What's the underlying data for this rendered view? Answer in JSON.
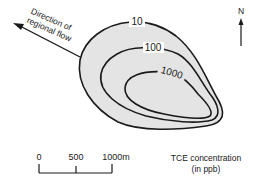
{
  "diagram": {
    "flow": {
      "line1": "Direction of",
      "line2": "regional flow"
    },
    "north_label": "N",
    "contours": [
      {
        "label": "10"
      },
      {
        "label": "100"
      },
      {
        "label": "1000"
      }
    ],
    "scale_bar": {
      "ticks": [
        "0",
        "500",
        "1000m"
      ]
    },
    "legend": {
      "line1": "TCE concentration",
      "line2": "(in ppb)"
    },
    "colors": {
      "plume_fill": "#e4e4e4",
      "line": "#1a1a1a",
      "background": "#ffffff"
    }
  }
}
